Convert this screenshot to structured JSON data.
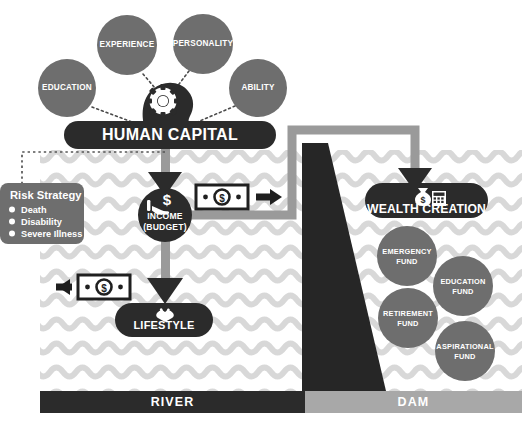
{
  "diagram": {
    "colors": {
      "dark": "#2b2b2b",
      "mid_gray": "#6e6e6e",
      "light_gray": "#a8a8a8",
      "wave_gray": "#d6d6d6",
      "pipe_gray": "#9a9a9a",
      "white": "#ffffff"
    },
    "attribute_circles": [
      {
        "label": "EDUCATION",
        "cx": 67,
        "cy": 88,
        "r": 29
      },
      {
        "label": "EXPERIENCE",
        "cx": 127,
        "cy": 45,
        "r": 30
      },
      {
        "label": "PERSONALITY",
        "cx": 203,
        "cy": 44,
        "r": 30
      },
      {
        "label": "ABILITY",
        "cx": 258,
        "cy": 88,
        "r": 29
      }
    ],
    "human_capital": {
      "label": "HUMAN CAPITAL",
      "icon": "head-gear-icon"
    },
    "income": {
      "label_line1": "INCOME",
      "label_line2": "(BUDGET)",
      "icon": "hand-holding-dollar-icon"
    },
    "lifestyle": {
      "label": "LIFESTYLE",
      "icon": "spending-icon"
    },
    "wealth_creation": {
      "label": "WEALTH CREATION",
      "icon": "money-bag-calculator-icon"
    },
    "risk_strategy": {
      "title": "Risk Strategy",
      "items": [
        "Death",
        "Disability",
        "Severe Illness"
      ]
    },
    "fund_circles": [
      {
        "label_line1": "EMERGENCY",
        "label_line2": "FUND",
        "cx": 407,
        "cy": 256,
        "r": 30
      },
      {
        "label_line1": "EDUCATION",
        "label_line2": "FUND",
        "cx": 463,
        "cy": 286,
        "r": 30
      },
      {
        "label_line1": "RETIREMENT",
        "label_line2": "FUND",
        "cx": 408,
        "cy": 318,
        "r": 30
      },
      {
        "label_line1": "ASPIRATIONAL",
        "label_line2": "FUND",
        "cx": 465,
        "cy": 351,
        "r": 30
      }
    ],
    "bottom_bars": [
      {
        "label": "RIVER",
        "tone": "dark"
      },
      {
        "label": "DAM",
        "tone": "light"
      }
    ],
    "money_notes": [
      {
        "name": "note-to-wealth",
        "direction": "right"
      },
      {
        "name": "note-to-lifestyle",
        "direction": "left"
      }
    ]
  }
}
